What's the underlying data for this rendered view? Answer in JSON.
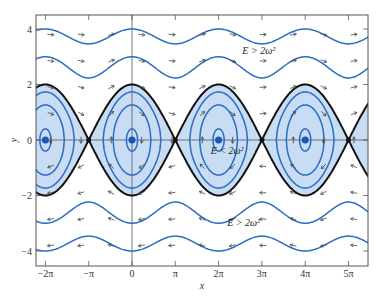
{
  "figure": {
    "xlabel": "x",
    "ylabel": "y",
    "xticks": [
      {
        "value": -6.2832,
        "label": "−2π"
      },
      {
        "value": -3.1416,
        "label": "−π"
      },
      {
        "value": 0,
        "label": "0"
      },
      {
        "value": 3.1416,
        "label": "π"
      },
      {
        "value": 6.2832,
        "label": "2π"
      },
      {
        "value": 9.4248,
        "label": "3π"
      },
      {
        "value": 12.5664,
        "label": "4π"
      },
      {
        "value": 15.708,
        "label": "5π"
      }
    ],
    "yticks": [
      {
        "value": 4,
        "label": "4"
      },
      {
        "value": 2,
        "label": "2"
      },
      {
        "value": 0,
        "label": "0"
      },
      {
        "value": -2,
        "label": "−2"
      },
      {
        "value": -4,
        "label": "−4"
      }
    ],
    "annotations": [
      {
        "text": "E > 2ω²",
        "x": 9.2,
        "y": 3.1,
        "name": "energy-label-upper"
      },
      {
        "text": "E < 2ω²",
        "x": 6.9,
        "y": -0.5,
        "name": "energy-label-middle"
      },
      {
        "text": "E > 2ω²",
        "x": 8.1,
        "y": -3.1,
        "name": "energy-label-lower"
      }
    ]
  },
  "chart_data": {
    "type": "phase-portrait",
    "title": "",
    "xlabel": "x",
    "ylabel": "y",
    "xlim": [
      -6.95,
      17.2
    ],
    "ylim": [
      -4.5,
      4.5
    ],
    "equation": "y^2/2 - ω^2 cos x = E, ω = 1",
    "separatrix": {
      "description": "y = ±2ω cos(x/2)",
      "energy": 1,
      "color": "#111111"
    },
    "closed_orbits_energy": [
      -0.92,
      -0.2,
      0.5
    ],
    "open_orbits_y_at_0": [
      4.0,
      3.0,
      -3.0,
      -4.0
    ],
    "equilibria_stable_x": [
      -6.2832,
      0,
      6.2832,
      12.5664
    ],
    "equilibria_saddle_x": [
      -3.1416,
      3.1416,
      9.4248,
      15.708
    ],
    "colors": {
      "orbit": "#2b6cc4",
      "fill": "#c8dcf3",
      "separatrix": "#111111",
      "arrow": "#444444",
      "axis": "#555555",
      "center_dot": "#1a56b8"
    },
    "legend": []
  }
}
